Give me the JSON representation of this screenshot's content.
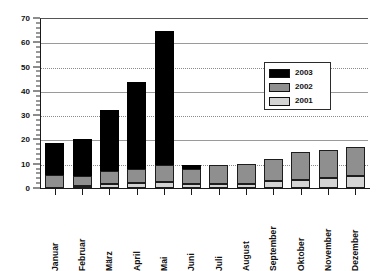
{
  "chart_data": {
    "type": "bar",
    "subtype": "stacked-vertical",
    "title": "",
    "subtitle": "",
    "xlabel": "",
    "ylabel": "",
    "ylim": [
      0,
      70
    ],
    "y_major_step": 10,
    "y_minor_step": 2,
    "grid": "horizontal-dotted",
    "legend_position": "inside-upper-right",
    "categories": [
      "Januar",
      "Februar",
      "März",
      "April",
      "Mai",
      "Juni",
      "Juli",
      "August",
      "September",
      "Oktober",
      "November",
      "Dezember"
    ],
    "y_ticks": [
      0,
      10,
      20,
      30,
      40,
      50,
      60,
      70
    ],
    "y_tick_labels": [
      "0",
      "10",
      "20",
      "30",
      "40",
      "50",
      "60",
      "70"
    ],
    "series": [
      {
        "name": "2001",
        "color": "#d4d4d4",
        "stack_order": 0,
        "values": [
          0,
          1,
          1.5,
          2,
          2.5,
          1.5,
          1.5,
          1.5,
          3,
          3.5,
          4,
          5
        ]
      },
      {
        "name": "2002",
        "color": "#8f8f8f",
        "stack_order": 1,
        "values": [
          5.5,
          4,
          5.5,
          6,
          7,
          6.5,
          8,
          8.5,
          9,
          11.5,
          11.5,
          12
        ]
      },
      {
        "name": "2003",
        "color": "#000000",
        "stack_order": 2,
        "values": [
          13,
          15,
          25,
          35.5,
          55,
          1.5,
          0,
          0,
          0,
          0,
          0,
          0
        ]
      }
    ],
    "totals": [
      18.5,
      20,
      32,
      43.5,
      64.5,
      9.5,
      9.5,
      10,
      12,
      15,
      15.5,
      17
    ]
  },
  "legend": {
    "entries": [
      {
        "label": "2003",
        "color": "#000000"
      },
      {
        "label": "2002",
        "color": "#8f8f8f"
      },
      {
        "label": "2001",
        "color": "#d4d4d4"
      }
    ]
  },
  "colors": {
    "axis": "#1a1a1a",
    "grid": "#8a8a8a",
    "background": "#ffffff",
    "text": "#111111"
  }
}
